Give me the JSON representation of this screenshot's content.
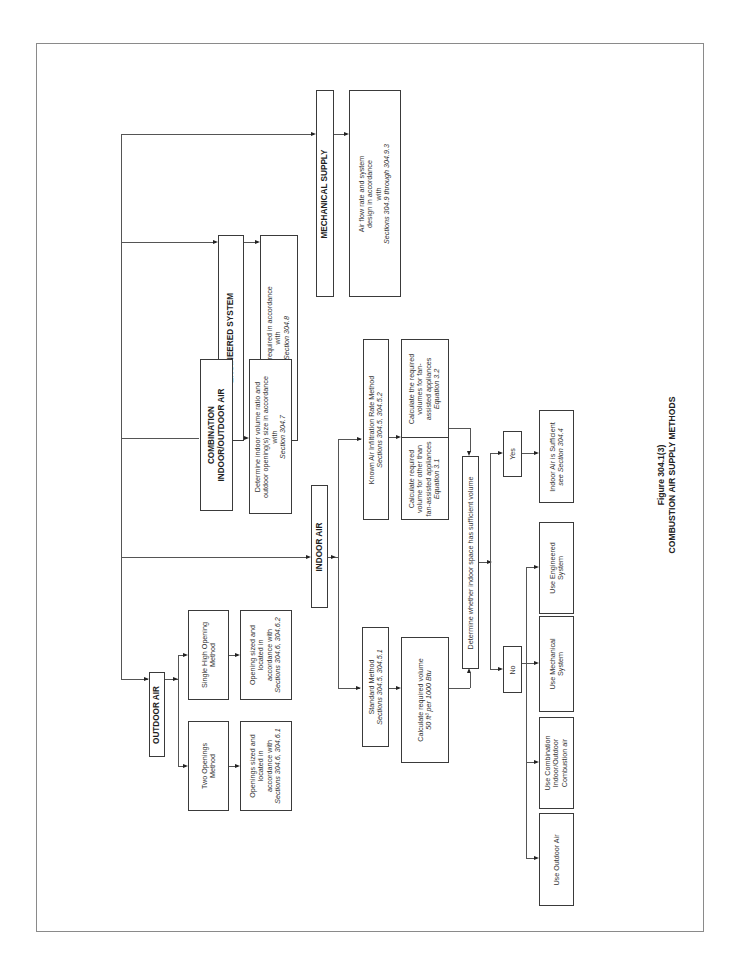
{
  "figure": {
    "number": "Figure 304.1(3)",
    "title": "COMBUSTION AIR SUPPLY METHODS",
    "orientation": "rotated 90 degrees counter-clockwise"
  },
  "nodes": {
    "outdoor_air": {
      "title": "OUTDOOR AIR"
    },
    "two_openings": {
      "line1": "Two Openings",
      "line2": "Method"
    },
    "two_openings_detail": {
      "line1": "Openings sized and",
      "line2": "located in",
      "line3": "accordance with",
      "line4": "Sections 304.6, 304.6.1"
    },
    "single_high": {
      "line1": "Single High Opening",
      "line2": "Method"
    },
    "single_high_detail": {
      "line1": "Opening sized and",
      "line2": "located in",
      "line3": "accordance with",
      "line4": "Sections 304.6, 304.6.2"
    },
    "indoor_air": {
      "title": "INDOOR AIR"
    },
    "standard_method": {
      "line1": "Standard Method",
      "line2": "Sections 304.5, 304.5.1"
    },
    "standard_calc": {
      "line1": "Calculate required volume",
      "line2": "50 ft³ per 1000 Btu"
    },
    "known_infiltration": {
      "line1": "Known Air Infiltration Rate Method",
      "line2": "Sections 304.5, 304.5.2"
    },
    "calc_other": {
      "line1": "Calculate required",
      "line2": "volume for other than",
      "line3": "fan-assisted appliances",
      "line4": "Equation 3.1"
    },
    "calc_fan": {
      "line1": "Calculate the required",
      "line2": "volumes for fan-",
      "line3": "assisted appliances",
      "line4": "Equation 3.2"
    },
    "determine_sufficient": {
      "line1": "Determine whether indoor space has sufficient volume"
    },
    "yes": {
      "label": "Yes"
    },
    "no": {
      "label": "No"
    },
    "indoor_sufficient": {
      "line1": "Indoor Air is Sufficient",
      "line2": "see Section 304.4"
    },
    "use_engineered": {
      "line1": "Use Engineered",
      "line2": "System"
    },
    "use_mechanical": {
      "line1": "Use Mechanical",
      "line2": "System"
    },
    "use_combination": {
      "line1": "Use Combination",
      "line2": "Indoor/Outdoor",
      "line3": "Combustion air"
    },
    "use_outdoor": {
      "line1": "Use Outdoor Air"
    },
    "combination": {
      "line1": "COMBINATION",
      "line2": "INDOOR/OUTDOOR AIR"
    },
    "combination_detail": {
      "line1": "Determine indoor volume ratio and",
      "line2": "outdoor opening(s) size in accordance",
      "line3": "with",
      "line4": "Section 304.7"
    },
    "engineered": {
      "title": "ENGINEERED SYSTEM"
    },
    "engineered_detail": {
      "line1": "Approval required in accordance",
      "line2": "with",
      "line3": "Section 304.8"
    },
    "mechanical": {
      "title": "MECHANICAL SUPPLY"
    },
    "mechanical_detail": {
      "line1": "Air flow rate and system",
      "line2": "design in accordance",
      "line3": "with",
      "line4": "Sections 304.9 through 304.9.3"
    }
  },
  "colors": {
    "line": "#555555",
    "border": "#3a3a3a",
    "text": "#333333",
    "background": "#ffffff"
  }
}
